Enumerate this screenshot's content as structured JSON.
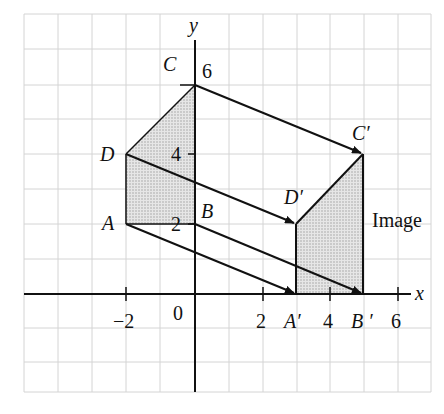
{
  "diagram": {
    "type": "translation",
    "axes": {
      "x_label": "x",
      "y_label": "y",
      "origin_label": "0",
      "x_ticks": [
        {
          "value": -2,
          "label": "−2"
        },
        {
          "value": 2,
          "label": "2"
        },
        {
          "value": 4,
          "label": "4"
        },
        {
          "value": 6,
          "label": "6"
        }
      ],
      "y_ticks": [
        {
          "value": 2,
          "label": "2"
        },
        {
          "value": 4,
          "label": "4"
        },
        {
          "value": 6,
          "label": "6"
        }
      ],
      "x_range": [
        -5,
        7
      ],
      "y_range": [
        -3,
        8
      ]
    },
    "object": {
      "vertices": [
        {
          "name": "A",
          "x": -2,
          "y": 2
        },
        {
          "name": "B",
          "x": 0,
          "y": 2
        },
        {
          "name": "C",
          "x": 0,
          "y": 6
        },
        {
          "name": "D",
          "x": -2,
          "y": 4
        }
      ],
      "labels": {
        "A": "A",
        "B": "B",
        "C": "C",
        "D": "D"
      }
    },
    "image": {
      "title": "Image",
      "vertices": [
        {
          "name": "A′",
          "x": 3,
          "y": 0
        },
        {
          "name": "B′",
          "x": 5,
          "y": 0
        },
        {
          "name": "C′",
          "x": 5,
          "y": 4
        },
        {
          "name": "D′",
          "x": 3,
          "y": 2
        }
      ],
      "labels": {
        "A": "A′",
        "B": "B ′",
        "C": "C′",
        "D": "D′"
      }
    },
    "translation_vector": {
      "dx": 5,
      "dy": -2
    },
    "colors": {
      "grid": "#d0d0d0",
      "lines": "#111111",
      "fill": "#d9d9d9"
    }
  }
}
